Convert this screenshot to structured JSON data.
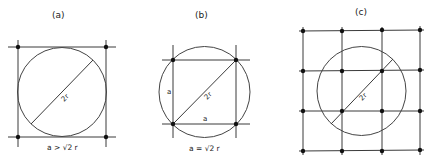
{
  "panels": [
    {
      "id": "a",
      "title": "(a)",
      "diameter_label": "2r",
      "caption": "a > √2 r",
      "description": "Circle of radius r inscribed in a square lattice cell larger than the circle; lattice points at square corners lie outside the circle."
    },
    {
      "id": "b",
      "title": "(b)",
      "diameter_label": "2r",
      "side_label_vertical": "a",
      "side_label_horizontal": "a",
      "caption": "a = √2 r",
      "description": "Square lattice cell inscribed in circle; diagonal equals the diameter 2r."
    },
    {
      "id": "c",
      "title": "(c)",
      "diameter_label": "2r",
      "description": "Circle of diameter 2r overlaid on a 4x4 square lattice with spacing smaller than the circle; several lattice points fall inside."
    }
  ],
  "colors": {
    "line": "#3a3a3a",
    "dot": "#111111",
    "background": "#ffffff"
  }
}
